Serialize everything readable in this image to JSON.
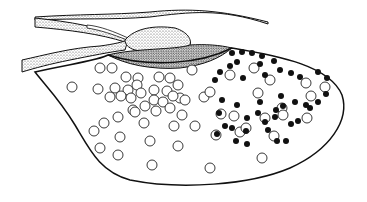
{
  "diagram": {
    "type": "anatomical-line-drawing",
    "colors": {
      "background": "#ffffff",
      "line": "#111111",
      "stipple_light": "#cfcfcf",
      "stipple_dark": "#a8a8a8",
      "dot": "#111111"
    },
    "open_circles": [
      [
        100,
        68
      ],
      [
        112,
        68
      ],
      [
        72,
        87
      ],
      [
        98,
        89
      ],
      [
        126,
        77
      ],
      [
        138,
        78
      ],
      [
        115,
        88
      ],
      [
        128,
        90
      ],
      [
        137,
        85
      ],
      [
        159,
        77
      ],
      [
        170,
        78
      ],
      [
        178,
        85
      ],
      [
        141,
        93
      ],
      [
        154,
        90
      ],
      [
        167,
        91
      ],
      [
        154,
        100
      ],
      [
        180,
        98
      ],
      [
        110,
        97
      ],
      [
        121,
        96
      ],
      [
        131,
        98
      ],
      [
        145,
        106
      ],
      [
        163,
        102
      ],
      [
        173,
        96
      ],
      [
        185,
        100
      ],
      [
        156,
        111
      ],
      [
        170,
        108
      ],
      [
        182,
        115
      ],
      [
        133,
        110
      ],
      [
        118,
        117
      ],
      [
        104,
        123
      ],
      [
        135,
        112
      ],
      [
        144,
        123
      ],
      [
        174,
        126
      ],
      [
        192,
        70
      ],
      [
        204,
        97
      ],
      [
        210,
        92
      ],
      [
        230,
        75
      ],
      [
        216,
        135
      ],
      [
        254,
        68
      ],
      [
        270,
        80
      ],
      [
        306,
        83
      ],
      [
        325,
        87
      ],
      [
        258,
        93
      ],
      [
        282,
        108
      ],
      [
        240,
        132
      ],
      [
        234,
        116
      ],
      [
        246,
        128
      ],
      [
        195,
        126
      ],
      [
        221,
        114
      ],
      [
        265,
        118
      ],
      [
        311,
        96
      ],
      [
        94,
        131
      ],
      [
        120,
        137
      ],
      [
        100,
        148
      ],
      [
        150,
        141
      ],
      [
        118,
        155
      ],
      [
        178,
        146
      ],
      [
        152,
        165
      ],
      [
        210,
        168
      ],
      [
        262,
        158
      ],
      [
        274,
        136
      ],
      [
        283,
        115
      ],
      [
        307,
        118
      ]
    ],
    "filled_dots": [
      [
        232,
        53
      ],
      [
        242,
        52
      ],
      [
        252,
        53
      ],
      [
        262,
        56
      ],
      [
        274,
        61
      ],
      [
        237,
        62
      ],
      [
        260,
        64
      ],
      [
        230,
        66
      ],
      [
        220,
        72
      ],
      [
        215,
        80
      ],
      [
        243,
        78
      ],
      [
        265,
        75
      ],
      [
        280,
        70
      ],
      [
        291,
        73
      ],
      [
        300,
        77
      ],
      [
        318,
        72
      ],
      [
        327,
        78
      ],
      [
        326,
        94
      ],
      [
        222,
        100
      ],
      [
        237,
        105
      ],
      [
        260,
        102
      ],
      [
        281,
        96
      ],
      [
        283,
        106
      ],
      [
        295,
        102
      ],
      [
        310,
        108
      ],
      [
        219,
        113
      ],
      [
        258,
        113
      ],
      [
        276,
        110
      ],
      [
        247,
        118
      ],
      [
        275,
        117
      ],
      [
        265,
        122
      ],
      [
        225,
        126
      ],
      [
        246,
        131
      ],
      [
        268,
        130
      ],
      [
        291,
        124
      ],
      [
        236,
        141
      ],
      [
        247,
        144
      ],
      [
        318,
        102
      ],
      [
        306,
        105
      ],
      [
        298,
        121
      ],
      [
        277,
        141
      ],
      [
        217,
        134
      ],
      [
        232,
        128
      ],
      [
        286,
        141
      ]
    ]
  }
}
